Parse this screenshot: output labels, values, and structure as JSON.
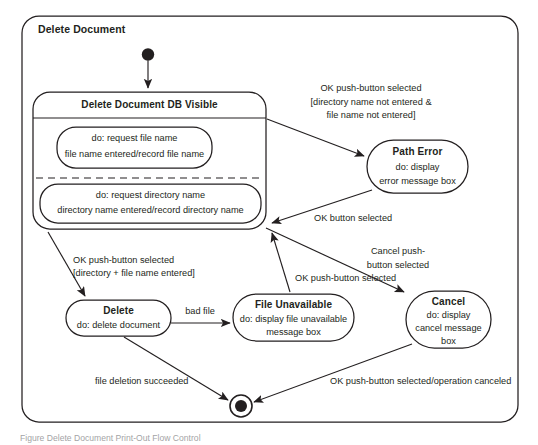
{
  "diagram": {
    "type": "uml-state-machine",
    "frame_title": "Delete Document",
    "caption": "Figure  Delete Document Print-Out Flow Control",
    "colors": {
      "stroke": "#231f20",
      "fill": "#ffffff",
      "background": "#ffffff"
    },
    "pseudostates": {
      "initial_label": "initial-state",
      "final_label": "final-state"
    },
    "composite_state": {
      "title": "Delete Document DB Visible",
      "regions": [
        {
          "name": "file-name-region",
          "lines": [
            "do: request file name",
            "file name entered/record file name"
          ]
        },
        {
          "name": "directory-name-region",
          "lines": [
            "do: request directory name",
            "directory name entered/record directory name"
          ]
        }
      ]
    },
    "states": [
      {
        "id": "path-error",
        "title": "Path Error",
        "lines": [
          "do: display",
          "error message box"
        ]
      },
      {
        "id": "delete",
        "title": "Delete",
        "lines": [
          "do: delete document"
        ]
      },
      {
        "id": "file-unavailable",
        "title": "File Unavailable",
        "lines": [
          "do: display file unavailable",
          "message box"
        ]
      },
      {
        "id": "cancel",
        "title": "Cancel",
        "lines": [
          "do: display",
          "cancel message",
          "box"
        ]
      }
    ],
    "transitions": [
      {
        "id": "to-path-error",
        "from": "delete-document-db-visible",
        "to": "path-error",
        "lines": [
          "OK push-button selected",
          "[directory name not entered &",
          "file name not entered]"
        ]
      },
      {
        "id": "path-error-return",
        "from": "path-error",
        "to": "delete-document-db-visible",
        "lines": [
          "OK button selected"
        ]
      },
      {
        "id": "to-delete",
        "from": "delete-document-db-visible",
        "to": "delete",
        "lines": [
          "OK push-button selected",
          "[directory + file name entered]"
        ]
      },
      {
        "id": "to-cancel",
        "from": "delete-document-db-visible",
        "to": "cancel",
        "lines": [
          "Cancel push-",
          "button selected"
        ]
      },
      {
        "id": "delete-bad-file",
        "from": "delete",
        "to": "file-unavailable",
        "lines": [
          "bad file"
        ]
      },
      {
        "id": "file-unavailable-return",
        "from": "file-unavailable",
        "to": "delete-document-db-visible",
        "lines": [
          "OK push-button selected"
        ]
      },
      {
        "id": "delete-success",
        "from": "delete",
        "to": "final-state",
        "lines": [
          "file deletion succeeded"
        ]
      },
      {
        "id": "cancel-to-final",
        "from": "cancel",
        "to": "final-state",
        "lines": [
          "OK push-button selected/operation canceled"
        ]
      }
    ]
  }
}
